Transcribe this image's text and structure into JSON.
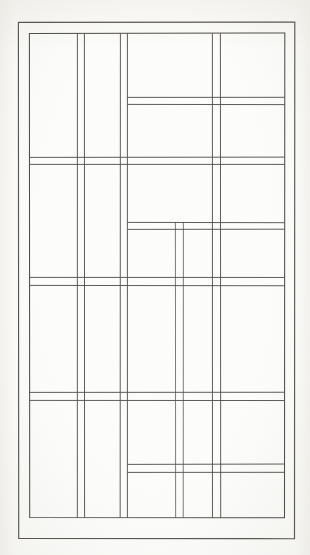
{
  "page": {
    "background_color": "#fcfcfa",
    "ink_color": "#4b4a47",
    "running_head": "",
    "running_head_visible_fragment": ""
  },
  "figure": {
    "title": "",
    "caption": "",
    "outer_frame": {
      "x": 18,
      "y": 13,
      "width": 277,
      "height": 517
    },
    "inner_frame": {
      "x": 29,
      "y": 24,
      "width": 256,
      "height": 485
    }
  },
  "chart_data": {
    "type": "line_drawing_grid",
    "title": "",
    "xlabel": "",
    "ylabel": "",
    "xlim": [
      0,
      310
    ],
    "ylim": [
      0,
      546
    ],
    "grid": false,
    "legend": null,
    "units": "pixels",
    "frames": [
      {
        "name": "outer-frame",
        "x1": 18,
        "y1": 13,
        "x2": 295,
        "y2": 530
      },
      {
        "name": "inner-frame",
        "x1": 29,
        "y1": 24,
        "x2": 285,
        "y2": 509
      }
    ],
    "vertical_lines": [
      {
        "name": "v1",
        "x": 29,
        "y1": 24,
        "y2": 509
      },
      {
        "name": "v2",
        "x": 77,
        "y1": 24,
        "y2": 509
      },
      {
        "name": "v3",
        "x": 84,
        "y1": 24,
        "y2": 509
      },
      {
        "name": "v4",
        "x": 120,
        "y1": 24,
        "y2": 509
      },
      {
        "name": "v5",
        "x": 127,
        "y1": 24,
        "y2": 509
      },
      {
        "name": "v6",
        "x": 175,
        "y1": 213,
        "y2": 509
      },
      {
        "name": "v7",
        "x": 183,
        "y1": 213,
        "y2": 509
      },
      {
        "name": "v8",
        "x": 212,
        "y1": 24,
        "y2": 509
      },
      {
        "name": "v9",
        "x": 220,
        "y1": 24,
        "y2": 509
      },
      {
        "name": "v10",
        "x": 285,
        "y1": 24,
        "y2": 509
      }
    ],
    "horizontal_lines": [
      {
        "name": "h1",
        "y": 24,
        "x1": 29,
        "x2": 285
      },
      {
        "name": "h2",
        "y": 88,
        "x1": 127,
        "x2": 285
      },
      {
        "name": "h3",
        "y": 95,
        "x1": 127,
        "x2": 285
      },
      {
        "name": "h4",
        "y": 148,
        "x1": 29,
        "x2": 285
      },
      {
        "name": "h5",
        "y": 155,
        "x1": 29,
        "x2": 285
      },
      {
        "name": "h6",
        "y": 213,
        "x1": 127,
        "x2": 285
      },
      {
        "name": "h7",
        "y": 220,
        "x1": 127,
        "x2": 285
      },
      {
        "name": "h8",
        "y": 268,
        "x1": 29,
        "x2": 285
      },
      {
        "name": "h9",
        "y": 276,
        "x1": 29,
        "x2": 285
      },
      {
        "name": "h10",
        "y": 383,
        "x1": 29,
        "x2": 285
      },
      {
        "name": "h11",
        "y": 391,
        "x1": 29,
        "x2": 285
      },
      {
        "name": "h12",
        "y": 455,
        "x1": 127,
        "x2": 285
      },
      {
        "name": "h13",
        "y": 463,
        "x1": 127,
        "x2": 285
      }
    ],
    "panel_count": 38
  }
}
